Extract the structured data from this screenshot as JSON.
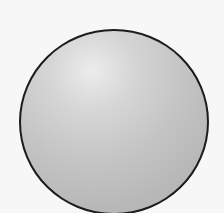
{
  "figure": {
    "shape": "sphere",
    "description": "Shaded gray sphere with black outline",
    "colors": {
      "background": "#f7f7f7",
      "outline": "#1c1c1c",
      "highlight": "#ececec",
      "fill": "#c4c4c4",
      "shadow": "#b2b2b2"
    }
  }
}
